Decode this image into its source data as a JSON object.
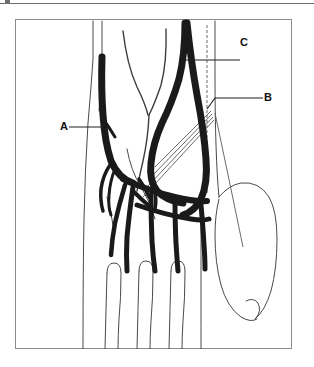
{
  "figure": {
    "title": "",
    "type": "anatomical-line-drawing",
    "background_color": "#ffffff",
    "frame_color": "#8c8c8c",
    "vein_color": "#1a1a1a",
    "outline_color": "#4a4a4a",
    "leader_color": "#3a3a3a",
    "rule_color": "#6f6f6f"
  },
  "labels": [
    {
      "id": "A",
      "text": "A",
      "position": "left",
      "leader": "horizontal"
    },
    {
      "id": "B",
      "text": "B",
      "position": "right",
      "leader": "horizontal-angled"
    },
    {
      "id": "C",
      "text": "C",
      "position": "right-top",
      "leader": "horizontal"
    }
  ],
  "top_rule": {
    "present": true,
    "tick_mark": true
  }
}
